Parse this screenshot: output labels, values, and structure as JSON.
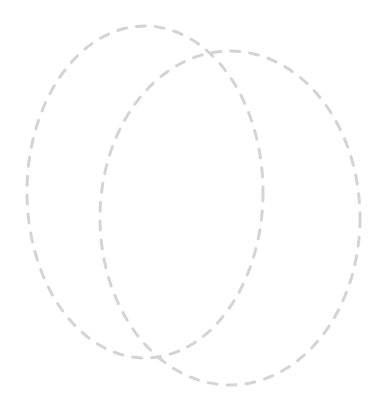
{
  "canvas": {
    "width": 388,
    "height": 413,
    "background_color": "#ffffff"
  },
  "diagram": {
    "type": "venn-outline",
    "title": "",
    "labels": [],
    "stroke_color": "#d4d4d4",
    "stroke_width": 3,
    "dash_length": 9,
    "gap_length": 10,
    "ellipses": [
      {
        "name": "left-ellipse",
        "cx": 145,
        "cy": 192,
        "rx": 118,
        "ry": 166
      },
      {
        "name": "right-ellipse",
        "cx": 230,
        "cy": 218,
        "rx": 130,
        "ry": 167
      }
    ]
  }
}
